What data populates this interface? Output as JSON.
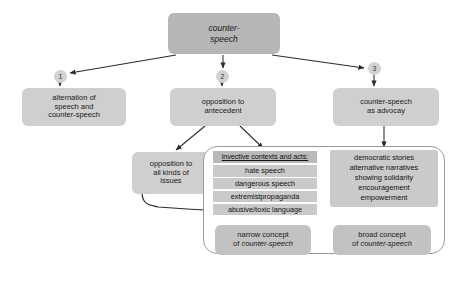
{
  "diagram": {
    "root": {
      "line1": "counter-",
      "line2": "speech"
    },
    "markers": {
      "one": "1",
      "two": "2",
      "three": "3"
    },
    "branches": {
      "alternation": {
        "line1": "alternation of",
        "line2": "speech and",
        "line3": "counter-speech"
      },
      "opposition": {
        "line1": "opposition to",
        "line2": "antecedent"
      },
      "advocacy": {
        "line1": "counter-speech",
        "line2": "as advocay"
      }
    },
    "all_kinds": {
      "line1": "opposition to",
      "line2": "all kinds of",
      "line3": "issues"
    },
    "invective": {
      "header": "invective contexts and acts:",
      "items": [
        "hate speech",
        "dangerous speech",
        "extremistpropaganda",
        "abusive/toxic language"
      ]
    },
    "advocacy_acts": {
      "items": [
        "democratic stories",
        "alternative narratives",
        "showing solidarity",
        "encouragement",
        "empowerment"
      ]
    },
    "concepts": {
      "narrow": {
        "line1": "narrow concept",
        "line2_prefix": "of ",
        "line2_italic": "counter-speech"
      },
      "broad": {
        "line1": "broad concept",
        "line2_prefix": "of ",
        "line2_italic": "counter-speech"
      }
    },
    "colors": {
      "box_dark": "#b6b6b6",
      "box_mid": "#c2c2c2",
      "box_light": "#cfcfcf",
      "panel_border": "#9a9a9a",
      "edge": "#2b2b2b",
      "background": "#ffffff"
    }
  }
}
